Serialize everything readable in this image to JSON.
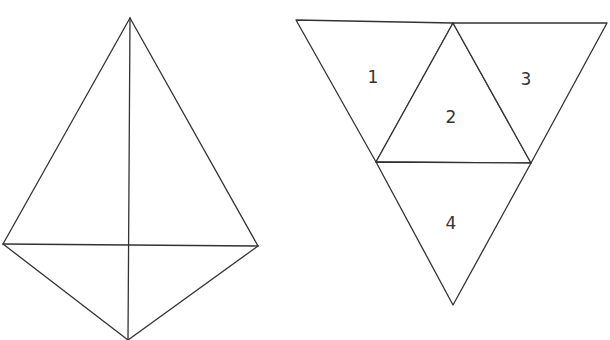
{
  "figure": {
    "left": {
      "description": "tetrahedron (3D view)",
      "vertices": {
        "apex": [
          130,
          18
        ],
        "left": [
          3,
          244
        ],
        "right": [
          258,
          246
        ],
        "bottom": [
          128,
          340
        ]
      },
      "edges": [
        [
          "apex",
          "left"
        ],
        [
          "apex",
          "right"
        ],
        [
          "apex",
          "bottom"
        ],
        [
          "left",
          "right"
        ],
        [
          "left",
          "bottom"
        ],
        [
          "right",
          "bottom"
        ]
      ]
    },
    "right": {
      "description": "net of tetrahedron with four numbered faces",
      "faces": [
        {
          "id": "1",
          "label": "1",
          "points": [
            [
              296,
              20
            ],
            [
              453,
              23
            ],
            [
              376,
              162
            ]
          ],
          "label_pos": [
            373,
            78
          ]
        },
        {
          "id": "2",
          "label": "2",
          "points": [
            [
              453,
              23
            ],
            [
              531,
              163
            ],
            [
              376,
              162
            ]
          ],
          "label_pos": [
            451,
            118
          ]
        },
        {
          "id": "3",
          "label": "3",
          "points": [
            [
              453,
              23
            ],
            [
              607,
              23
            ],
            [
              531,
              163
            ]
          ],
          "label_pos": [
            526,
            80
          ]
        },
        {
          "id": "4",
          "label": "4",
          "points": [
            [
              376,
              162
            ],
            [
              531,
              163
            ],
            [
              453,
              305
            ]
          ],
          "label_pos": [
            451,
            224
          ]
        }
      ]
    }
  },
  "colors": {
    "stroke": "#333333",
    "background": "#ffffff"
  }
}
